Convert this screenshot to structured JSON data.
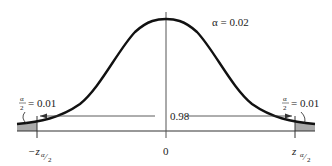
{
  "diagram": {
    "alpha_label": "α = 0.02",
    "left_tail": {
      "label_num": "α",
      "label_den": "2",
      "label_value": "= 0.01",
      "critical_value_label": "−z",
      "critical_sub_num": "α",
      "critical_sub_den": "2"
    },
    "right_tail": {
      "label_num": "α",
      "label_den": "2",
      "label_value": "= 0.01",
      "critical_value_label": "z",
      "critical_sub_num": "α",
      "critical_sub_den": "2"
    },
    "center_label": "0",
    "middle_area_label": "0.98",
    "colors": {
      "curve": "#111111",
      "shade": "#aaaaaa",
      "axis": "#333333"
    }
  }
}
